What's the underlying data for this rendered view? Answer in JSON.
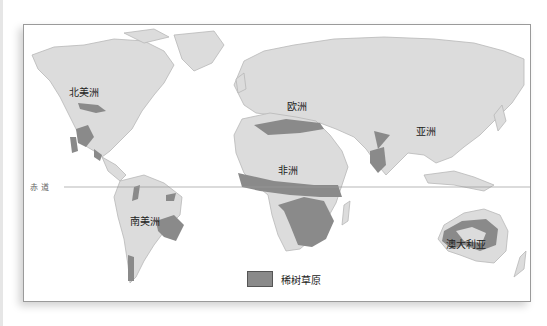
{
  "map": {
    "title": "",
    "continents": [
      {
        "id": "north-america",
        "label": "北美洲"
      },
      {
        "id": "europe",
        "label": "欧洲"
      },
      {
        "id": "asia",
        "label": "亚洲"
      },
      {
        "id": "africa",
        "label": "非洲"
      },
      {
        "id": "south-america",
        "label": "南美洲"
      },
      {
        "id": "australia",
        "label": "澳大利亚"
      }
    ],
    "equator_label": "赤道",
    "legend": {
      "label": "稀树草原",
      "color": "#8a8a8a"
    },
    "colors": {
      "land": "#dcdcdc",
      "savanna": "#8a8a8a",
      "ocean": "#ffffff",
      "coast": "#b8b8b8"
    }
  }
}
